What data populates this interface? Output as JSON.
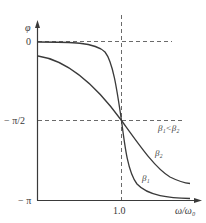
{
  "diagram": {
    "title": "",
    "y_axis": {
      "label": "φ",
      "ticks": [
        {
          "label": "0",
          "value": 0
        },
        {
          "label": "− π/2",
          "value": -1.5708
        },
        {
          "label": "− π",
          "value": -3.1416
        }
      ]
    },
    "x_axis": {
      "label": "ω/ω₀",
      "ticks": [
        {
          "label": "1.0",
          "value": 1.0
        }
      ]
    },
    "reference_lines": [
      {
        "orientation": "horizontal",
        "at": "0",
        "style": "dashed"
      },
      {
        "orientation": "horizontal",
        "at": "−π/2",
        "style": "dashed"
      },
      {
        "orientation": "vertical",
        "at": "1.0",
        "style": "dashed"
      }
    ],
    "curves": [
      {
        "name": "β₁",
        "label": "β₁",
        "description": "steep phase transition (smaller damping)"
      },
      {
        "name": "β₂",
        "label": "β₂",
        "description": "gradual phase transition (larger damping)"
      }
    ],
    "annotation": "β₁<β₂",
    "colors": {
      "line": "#3a3a3a",
      "dashed": "#6a6a6a",
      "background": "#ffffff"
    }
  }
}
